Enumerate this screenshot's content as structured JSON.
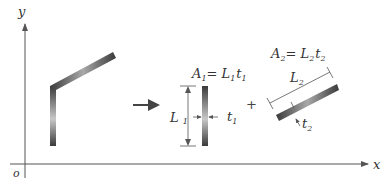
{
  "axes": {
    "x_label": "x",
    "y_label": "y",
    "origin_label": "o"
  },
  "original_shape": {
    "description": "L-shaped thin-walled section composed of a vertical segment and an inclined segment"
  },
  "transform_arrow": "→",
  "part1": {
    "area_label": "A",
    "area_sub": "1",
    "eq": "= ",
    "L": "L",
    "L_sub": "1",
    "t": "t",
    "t_sub": "1",
    "length_label": "L",
    "length_sub": "1",
    "thickness_label": "t",
    "thickness_sub": "1"
  },
  "plus": "+",
  "part2": {
    "area_label": "A",
    "area_sub": "2",
    "eq": "= ",
    "L": "L",
    "L_sub": "2",
    "t": "t",
    "t_sub": "2",
    "length_label": "L",
    "length_sub": "2",
    "thickness_label": "t",
    "thickness_sub": "2"
  },
  "colors": {
    "axis": "#555555",
    "bar_dark": "#3a3a3a",
    "bar_light": "#bdbdbd",
    "text": "#333333"
  }
}
